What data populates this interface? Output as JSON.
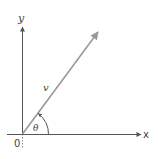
{
  "diagram": {
    "type": "vector-angle-diagram",
    "colors": {
      "axis": "#555555",
      "vector": "#999999",
      "text": "#444444",
      "background": "#ffffff"
    },
    "axes": {
      "x_label": "x",
      "y_label": "y",
      "origin_label": "0"
    },
    "vector": {
      "label": "v",
      "from": [
        22,
        134
      ],
      "to": [
        98,
        32
      ]
    },
    "angle": {
      "label": "θ",
      "radius": 26
    }
  }
}
